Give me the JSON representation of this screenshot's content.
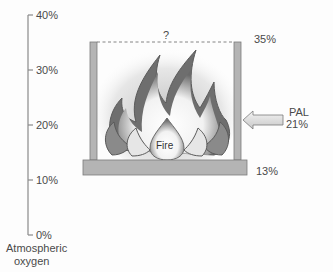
{
  "axis": {
    "title_line1": "Atmospheric",
    "title_line2": "oxygen",
    "ticks": [
      {
        "label": "40%",
        "value": 40
      },
      {
        "label": "30%",
        "value": 30
      },
      {
        "label": "20%",
        "value": 20
      },
      {
        "label": "10%",
        "value": 10
      },
      {
        "label": "0%",
        "value": 0
      }
    ]
  },
  "diagram": {
    "upper_limit_label": "35%",
    "upper_limit_unknown": "?",
    "lower_limit_label": "13%",
    "center_label": "Fire",
    "arrow_label_line1": "PAL",
    "arrow_label_line2": "21%"
  },
  "colors": {
    "frame_fill": "#b4b4b4",
    "frame_stroke": "#7a7a7a",
    "axis_line": "#888888",
    "flame_dark": "#5a5a5a"
  }
}
